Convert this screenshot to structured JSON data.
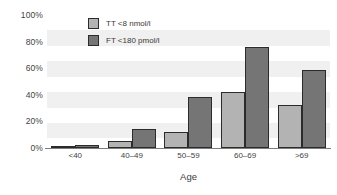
{
  "chart_data": {
    "type": "bar",
    "title": "",
    "xlabel": "Age",
    "ylabel": "",
    "categories": [
      "<40",
      "40–49",
      "50–59",
      "60–69",
      ">69"
    ],
    "series": [
      {
        "name": "TT <8 nmol/l",
        "color": "#b3b3b3",
        "values": [
          1,
          5,
          12,
          42,
          32
        ]
      },
      {
        "name": "FT <180 pmol/l",
        "color": "#757575",
        "values": [
          2,
          14,
          38,
          76,
          59
        ]
      }
    ],
    "ylim": [
      0,
      100
    ],
    "ytick_labels": [
      "0%",
      "20%",
      "40%",
      "60%",
      "80%",
      "100%"
    ],
    "ytick_values": [
      0,
      20,
      40,
      60,
      80,
      100
    ],
    "grid": true,
    "grid_style": "alternating-bands",
    "grid_color": "#f0f0f0",
    "legend_position": "top-left-inside",
    "background": "#ffffff"
  },
  "legend": {
    "items": [
      {
        "label": "TT <8 nmol/l"
      },
      {
        "label": "FT <180 pmol/l"
      }
    ]
  },
  "axis": {
    "x_title": "Age"
  }
}
